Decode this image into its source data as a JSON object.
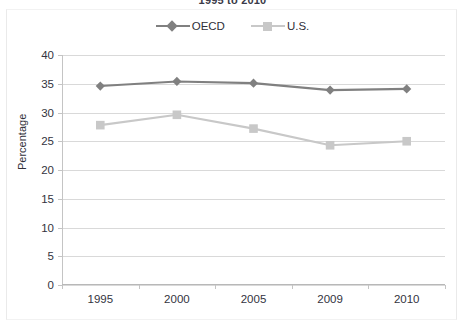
{
  "chart_data": {
    "type": "line",
    "title": "1995 to 2010",
    "xlabel": "",
    "ylabel": "Percentage",
    "categories": [
      "1995",
      "2000",
      "2005",
      "2009",
      "2010"
    ],
    "series": [
      {
        "name": "OECD",
        "values": [
          34.6,
          35.4,
          35.1,
          33.9,
          34.1
        ],
        "color": "#808080",
        "marker": "diamond"
      },
      {
        "name": "U.S.",
        "values": [
          27.8,
          29.6,
          27.2,
          24.3,
          25.0
        ],
        "color": "#c8c8c8",
        "marker": "square"
      }
    ],
    "ylim": [
      0,
      40
    ],
    "ytick_step": 5,
    "yticks": [
      "0",
      "5",
      "10",
      "15",
      "20",
      "25",
      "30",
      "35",
      "40"
    ],
    "grid": true,
    "legend_position": "top-center"
  },
  "legend": {
    "items": [
      {
        "label": "OECD",
        "marker_icon": "diamond-marker-icon"
      },
      {
        "label": "U.S.",
        "marker_icon": "square-marker-icon"
      }
    ]
  },
  "colors": {
    "oecd": "#808080",
    "us": "#c8c8c8",
    "gridline": "#d9d9d9",
    "axis": "#c4c4c4",
    "text": "#333340"
  }
}
